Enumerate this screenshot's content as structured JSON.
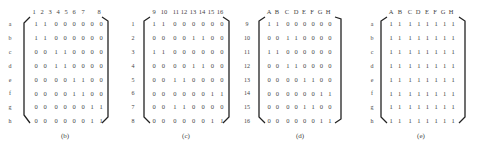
{
  "figure": {
    "panels": [
      {
        "id": "b",
        "caption": "(b)",
        "col_labels": [
          "1",
          "2",
          "3",
          "4",
          "5",
          "6",
          "7",
          "8"
        ],
        "row_labels": [
          "a",
          "b",
          "c",
          "d",
          "e",
          "f",
          "g",
          "h"
        ],
        "rows": [
          [
            "1",
            "1",
            "0",
            "0",
            "0",
            "0",
            "0",
            "0"
          ],
          [
            "1",
            "1",
            "0",
            "0",
            "0",
            "0",
            "0",
            "0"
          ],
          [
            "0",
            "0",
            "1",
            "1",
            "0",
            "0",
            "0",
            "0"
          ],
          [
            "0",
            "0",
            "1",
            "1",
            "0",
            "0",
            "0",
            "0"
          ],
          [
            "0",
            "0",
            "0",
            "0",
            "1",
            "1",
            "0",
            "0"
          ],
          [
            "0",
            "0",
            "0",
            "0",
            "1",
            "1",
            "0",
            "0"
          ],
          [
            "0",
            "0",
            "0",
            "0",
            "0",
            "0",
            "1",
            "1"
          ],
          [
            "0",
            "0",
            "0",
            "0",
            "0",
            "0",
            "1",
            "1"
          ]
        ]
      },
      {
        "id": "c",
        "caption": "(c)",
        "col_labels": [
          "9",
          "10",
          "11",
          "12",
          "13",
          "14",
          "15",
          "16"
        ],
        "row_labels": [
          "1",
          "2",
          "3",
          "4",
          "5",
          "6",
          "7",
          "8"
        ],
        "rows": [
          [
            "1",
            "1",
            "0",
            "0",
            "0",
            "0",
            "0",
            "0"
          ],
          [
            "0",
            "0",
            "0",
            "0",
            "1",
            "1",
            "0",
            "0"
          ],
          [
            "1",
            "1",
            "0",
            "0",
            "0",
            "0",
            "0",
            "0"
          ],
          [
            "0",
            "0",
            "0",
            "0",
            "1",
            "1",
            "0",
            "0"
          ],
          [
            "0",
            "0",
            "1",
            "1",
            "0",
            "0",
            "0",
            "0"
          ],
          [
            "0",
            "0",
            "0",
            "0",
            "0",
            "0",
            "1",
            "1"
          ],
          [
            "0",
            "0",
            "1",
            "1",
            "0",
            "0",
            "0",
            "0"
          ],
          [
            "0",
            "0",
            "0",
            "0",
            "0",
            "0",
            "1",
            "1"
          ]
        ]
      },
      {
        "id": "d",
        "caption": "(d)",
        "col_labels": [
          "A",
          "B",
          "C",
          "D",
          "E",
          "F",
          "G",
          "H"
        ],
        "row_labels": [
          "9",
          "10",
          "11",
          "12",
          "13",
          "14",
          "15",
          "16"
        ],
        "rows": [
          [
            "1",
            "1",
            "0",
            "0",
            "0",
            "0",
            "0",
            "0"
          ],
          [
            "0",
            "0",
            "1",
            "1",
            "0",
            "0",
            "0",
            "0"
          ],
          [
            "1",
            "1",
            "0",
            "0",
            "0",
            "0",
            "0",
            "0"
          ],
          [
            "0",
            "0",
            "1",
            "1",
            "0",
            "0",
            "0",
            "0"
          ],
          [
            "0",
            "0",
            "0",
            "0",
            "1",
            "1",
            "0",
            "0"
          ],
          [
            "0",
            "0",
            "0",
            "0",
            "0",
            "0",
            "1",
            "1"
          ],
          [
            "0",
            "0",
            "0",
            "0",
            "1",
            "1",
            "0",
            "0"
          ],
          [
            "0",
            "0",
            "0",
            "0",
            "0",
            "0",
            "1",
            "1"
          ]
        ]
      },
      {
        "id": "e",
        "caption": "(e)",
        "col_labels": [
          "A",
          "B",
          "C",
          "D",
          "E",
          "F",
          "G",
          "H"
        ],
        "row_labels": [
          "a",
          "b",
          "c",
          "d",
          "e",
          "f",
          "g",
          "h"
        ],
        "rows": [
          [
            "1",
            "1",
            "1",
            "1",
            "1",
            "1",
            "1",
            "1"
          ],
          [
            "1",
            "1",
            "1",
            "1",
            "1",
            "1",
            "1",
            "1"
          ],
          [
            "1",
            "1",
            "1",
            "1",
            "1",
            "1",
            "1",
            "1"
          ],
          [
            "1",
            "1",
            "1",
            "1",
            "1",
            "1",
            "1",
            "1"
          ],
          [
            "1",
            "1",
            "1",
            "1",
            "1",
            "1",
            "1",
            "1"
          ],
          [
            "1",
            "1",
            "1",
            "1",
            "1",
            "1",
            "1",
            "1"
          ],
          [
            "1",
            "1",
            "1",
            "1",
            "1",
            "1",
            "1",
            "1"
          ],
          [
            "1",
            "1",
            "1",
            "1",
            "1",
            "1",
            "1",
            "1"
          ]
        ]
      }
    ]
  },
  "colors": {
    "text": "#444444",
    "bracket": "#222222",
    "background": "#ffffff"
  }
}
